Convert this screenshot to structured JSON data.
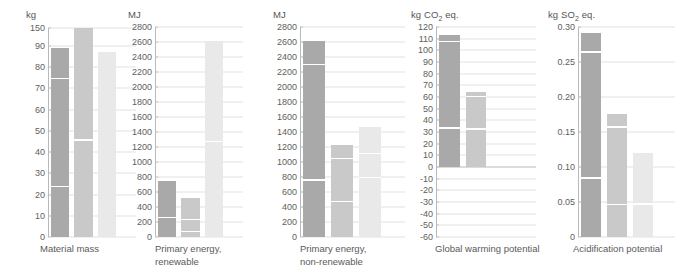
{
  "figure": {
    "type": "multi-panel-bar-chart",
    "panel_count": 5,
    "series_names": [
      "Variant 1",
      "Variant 2",
      "Variant 3"
    ],
    "series_colors": [
      "#a9a9a9",
      "#c9c9c9",
      "#e9e9e9"
    ]
  },
  "chart_data": [
    {
      "type": "bar",
      "title": "Material mass",
      "ylabel": "kg",
      "xlabel": "",
      "categories": [
        "Variant 1",
        "Variant 2",
        "Variant 3"
      ],
      "values": [
        89,
        90.5,
        87
      ],
      "segment_breaks": [
        [
          24,
          75
        ],
        [
          46
        ],
        []
      ],
      "ylim": [
        0,
        150
      ],
      "broken_axis": true,
      "break_above": 90,
      "ticks": [
        0,
        10,
        20,
        30,
        40,
        50,
        60,
        70,
        80,
        90,
        150
      ],
      "tick_labels": [
        "0",
        "10",
        "20",
        "30",
        "40",
        "50",
        "60",
        "70",
        "80",
        "90",
        "150"
      ],
      "grid": true,
      "legend": "none"
    },
    {
      "type": "bar",
      "title": "Primary energy,\nrenewable",
      "ylabel": "MJ",
      "xlabel": "",
      "categories": [
        "Variant 1",
        "Variant 2",
        "Variant 3"
      ],
      "values": [
        750,
        525,
        2620
      ],
      "segment_breaks": [
        [
          270
        ],
        [
          80,
          240
        ],
        [
          1280
        ]
      ],
      "ylim": [
        0,
        2800
      ],
      "broken_axis": false,
      "ticks": [
        0,
        200,
        400,
        600,
        800,
        1000,
        1200,
        1400,
        1600,
        1800,
        2000,
        2200,
        2400,
        2600,
        2800
      ],
      "tick_labels": [
        "0",
        "200",
        "400",
        "600",
        "800",
        "1000",
        "1200",
        "1400",
        "1600",
        "1800",
        "2000",
        "2200",
        "2400",
        "2600",
        "2800"
      ],
      "grid": true,
      "legend": "none"
    },
    {
      "type": "bar",
      "title": "Primary energy,\nnon-renewable",
      "ylabel": "MJ",
      "xlabel": "",
      "categories": [
        "Variant 1",
        "Variant 2",
        "Variant 3"
      ],
      "values": [
        2620,
        1230,
        1470
      ],
      "segment_breaks": [
        [
          770,
          2310
        ],
        [
          480,
          1060
        ],
        [
          800,
          1120
        ]
      ],
      "ylim": [
        0,
        2800
      ],
      "broken_axis": false,
      "ticks": [
        0,
        200,
        400,
        600,
        800,
        1000,
        1200,
        1400,
        1600,
        1800,
        2000,
        2200,
        2400,
        2600,
        2800
      ],
      "tick_labels": [
        "0",
        "200",
        "400",
        "600",
        "800",
        "1000",
        "1200",
        "1400",
        "1600",
        "1800",
        "2000",
        "2200",
        "2400",
        "2600",
        "2800"
      ],
      "grid": true,
      "legend": "none"
    },
    {
      "type": "bar",
      "title": "Global warming potential",
      "ylabel": "kg CO2 eq.",
      "ylabel_html": "kg CO<sub>2</sub> eq.",
      "xlabel": "",
      "categories": [
        "Variant 1",
        "Variant 2",
        "Variant 3"
      ],
      "values": [
        113,
        64,
        -41
      ],
      "segment_breaks": [
        [
          34,
          108
        ],
        [
          33,
          61
        ],
        [
          -50
        ]
      ],
      "ylim": [
        -60,
        120
      ],
      "broken_axis": false,
      "ticks": [
        -60,
        -50,
        -40,
        -30,
        -20,
        -10,
        0,
        10,
        20,
        30,
        40,
        50,
        60,
        70,
        80,
        90,
        100,
        110,
        120
      ],
      "tick_labels": [
        "-60",
        "-50",
        "-40",
        "-30",
        "-20",
        "-10",
        "0",
        "10",
        "20",
        "30",
        "40",
        "50",
        "60",
        "70",
        "80",
        "90",
        "100",
        "110",
        "120"
      ],
      "grid": true,
      "legend": "none"
    },
    {
      "type": "bar",
      "title": "Acidification potential",
      "ylabel": "kg SO2 eq.",
      "ylabel_html": "kg SO<sub>2</sub> eq.",
      "xlabel": "",
      "categories": [
        "Variant 1",
        "Variant 2",
        "Variant 3"
      ],
      "values": [
        0.292,
        0.176,
        0.12
      ],
      "segment_breaks": [
        [
          0.085,
          0.265
        ],
        [
          0.047,
          0.158
        ],
        [
          0.048
        ]
      ],
      "ylim": [
        0,
        0.3
      ],
      "broken_axis": false,
      "ticks": [
        0,
        0.05,
        0.1,
        0.15,
        0.2,
        0.25,
        0.3
      ],
      "tick_labels": [
        "0",
        "0.05",
        "0.10",
        "0.15",
        "0.20",
        "0.25",
        "0.30"
      ],
      "grid": true,
      "legend": "none"
    }
  ]
}
